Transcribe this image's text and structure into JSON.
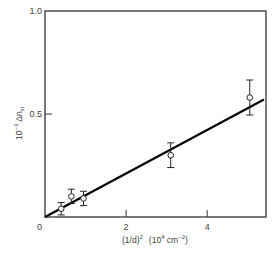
{
  "chart_data": {
    "type": "scatter",
    "title": "",
    "xlabel": "(1/d)² (10⁴ cm⁻²)",
    "ylabel": "10⁻³ Δn_st",
    "xlim": [
      0,
      5.45
    ],
    "ylim": [
      0,
      1.0
    ],
    "x_ticks": [
      0,
      2,
      4
    ],
    "x_tick_labels": [
      "0",
      "2",
      "4"
    ],
    "y_ticks": [
      0,
      0.5,
      1.0
    ],
    "y_tick_labels": [
      "0",
      "0.5",
      "1.0"
    ],
    "grid": false,
    "legend": null,
    "series": [
      {
        "name": "measured",
        "marker": "open-circle",
        "error_bars": true,
        "points": [
          {
            "x": 0.4,
            "y": 0.04,
            "err": 0.03
          },
          {
            "x": 0.65,
            "y": 0.1,
            "err": 0.035
          },
          {
            "x": 0.95,
            "y": 0.09,
            "err": 0.035
          },
          {
            "x": 3.1,
            "y": 0.3,
            "err": 0.06
          },
          {
            "x": 5.05,
            "y": 0.58,
            "err": 0.085
          }
        ]
      },
      {
        "name": "linear fit",
        "type": "line",
        "x": [
          0,
          5.4
        ],
        "y": [
          0,
          0.57
        ]
      }
    ],
    "colors": {
      "line": "#000000",
      "frame": "#333333",
      "text": "#444444"
    }
  },
  "labels": {
    "xlabel_main": "(1/d)",
    "xlabel_sup": "2",
    "xlabel_units": "(10",
    "xlabel_units_sup": "4",
    "xlabel_units_tail": " cm",
    "xlabel_units_sup2": "−2",
    "xlabel_close": ")",
    "ylabel_prefix": "10",
    "ylabel_sup": "−3",
    "ylabel_main": " Δn",
    "ylabel_sub": "st"
  }
}
